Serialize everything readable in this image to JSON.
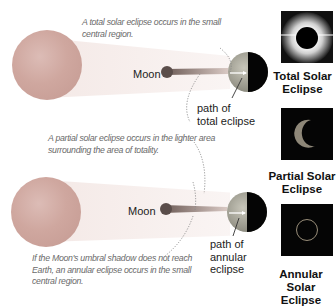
{
  "diagram": {
    "notes": {
      "total": "A total solar eclipse occurs in the small central region.",
      "total_line1": "A total solar eclipse occurs in the small",
      "total_line2": "central region.",
      "partial_line1": "A partial solar eclipse occurs in the lighter area",
      "partial_line2": "surrounding the area of totality.",
      "annular_line1": "If the Moon's umbral shadow does not reach",
      "annular_line2": "Earth, an annular eclipse occurs in the small",
      "annular_line3": "central region."
    },
    "top_scene": {
      "moon_label": "Moon",
      "path_label_line1": "path of",
      "path_label_line2": "total eclipse"
    },
    "bottom_scene": {
      "moon_label": "Moon",
      "path_label_line1": "path of",
      "path_label_line2": "annular",
      "path_label_line3": "eclipse"
    },
    "thumbnails": [
      {
        "caption_line1": "Total Solar",
        "caption_line2": "Eclipse",
        "icon": "total-eclipse-photo"
      },
      {
        "caption_line1": "Partial Solar",
        "caption_line2": "Eclipse",
        "icon": "partial-eclipse-photo"
      },
      {
        "caption_line1": "Annular Solar",
        "caption_line2": "Eclipse",
        "icon": "annular-eclipse-photo"
      }
    ],
    "colors": {
      "sun": "#cfa79f",
      "earth_day": "#a9a89a",
      "earth_night": "#000000",
      "note_text": "#6a6a6a",
      "thumb_bg": "#050505"
    }
  }
}
